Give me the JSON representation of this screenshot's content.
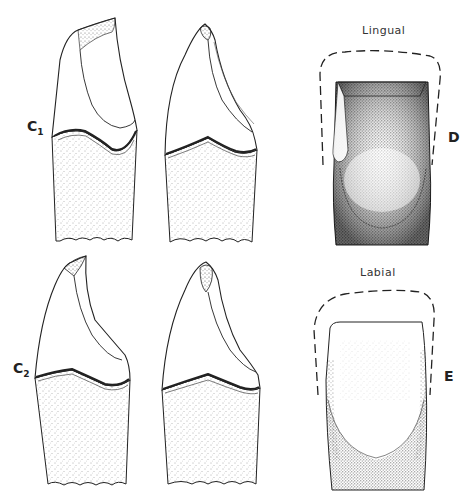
{
  "figure": {
    "rows": [
      {
        "id": "C1",
        "label_main": "C",
        "label_sub": "1",
        "views": [
          "tooth-left",
          "tooth-right"
        ]
      },
      {
        "id": "C2",
        "label_main": "C",
        "label_sub": "2",
        "views": [
          "tooth-left",
          "tooth-right"
        ]
      }
    ],
    "panels": [
      {
        "id": "D",
        "label": "D",
        "title": "Lingual"
      },
      {
        "id": "E",
        "label": "E",
        "title": "Labial"
      }
    ]
  },
  "colors": {
    "line": "#222222",
    "stipple": "#444444",
    "background": "#ffffff"
  }
}
